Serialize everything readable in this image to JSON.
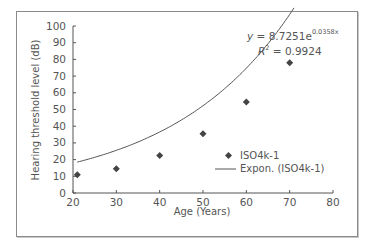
{
  "chart_data": {
    "type": "scatter",
    "title": "",
    "xlabel": "Age (Years)",
    "ylabel": "Hearing threshold level (dB)",
    "xlim": [
      20,
      80
    ],
    "ylim": [
      0,
      100
    ],
    "xticks": [
      20,
      30,
      40,
      50,
      60,
      70,
      80
    ],
    "yticks": [
      0,
      10,
      20,
      30,
      40,
      50,
      60,
      70,
      80,
      90,
      100
    ],
    "grid": false,
    "legend_position": "lower right (inside plot)",
    "series": [
      {
        "name": "ISO4k-1",
        "marker": "diamond",
        "x": [
          21,
          30,
          40,
          50,
          60,
          70
        ],
        "y": [
          11,
          14.5,
          22.5,
          35.5,
          54.5,
          78
        ]
      },
      {
        "name": "Expon. (ISO4k-1)",
        "type": "line",
        "equation": "y = 8.7251e^(0.0358x)",
        "r_squared": 0.9924,
        "x_range": [
          21,
          71
        ]
      }
    ],
    "annotations": [
      "y = 8.7251e^0.0358x",
      "R² = 0.9924"
    ]
  },
  "labels": {
    "xlabel": "Age (Years)",
    "ylabel": "Hearing threshold level (dB)",
    "eq_main": "y = 8.7251e",
    "eq_exp": "0.0358x",
    "r2_label": "R",
    "r2_sup": "2",
    "r2_value": " = 0.9924",
    "legend_series": "ISO4k-1",
    "legend_trend": "Expon. (ISO4k-1)"
  },
  "colors": {
    "marker": "#444444",
    "line": "#555555",
    "axis": "#555555"
  }
}
